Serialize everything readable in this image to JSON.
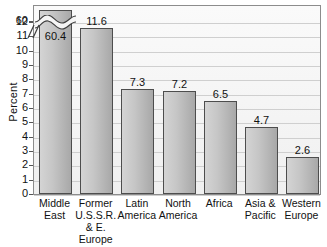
{
  "chart_data": {
    "type": "bar",
    "title": "",
    "subtitle": "",
    "xlabel": "",
    "ylabel": "Percent",
    "categories": [
      "Middle\nEast",
      "Former\nU.S.S.R.\n& E.\nEurope",
      "Latin\nAmerica",
      "North\nAmerica",
      "Africa",
      "Asia &\nPacific",
      "Western\nEurope"
    ],
    "values": [
      60.4,
      11.6,
      7.3,
      7.2,
      6.5,
      4.7,
      2.6
    ],
    "value_labels": [
      "60.4",
      "11.6",
      "7.3",
      "7.2",
      "6.5",
      "4.7",
      "2.6"
    ],
    "ylim": [
      0,
      12
    ],
    "y_ticks": [
      0,
      1,
      2,
      3,
      4,
      5,
      6,
      7,
      8,
      9,
      10,
      11,
      12
    ],
    "y_tick_labels": [
      "0",
      "1",
      "2",
      "3",
      "4",
      "5",
      "6",
      "7",
      "8",
      "9",
      "10",
      "11",
      "12"
    ],
    "broken_axis": {
      "present": true,
      "break_above": 12,
      "resumed_tick_value": 60,
      "resumed_tick_label": "60"
    },
    "grid": true,
    "legend": false,
    "bar_color": "#c6c6c6",
    "bar_border_color": "#4d4d4d",
    "plot_background": "#f2f2f2",
    "gridline_color": "#cfcfcf",
    "axis_color": "#8c8c8c"
  },
  "axis": {
    "y_title": "Percent",
    "top_tick_label": "60"
  }
}
